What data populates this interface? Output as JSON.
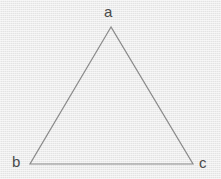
{
  "figure": {
    "type": "triangle-diagram",
    "canvas": {
      "width": 221,
      "height": 179
    },
    "colors": {
      "background": "#e9e9e9",
      "stroke": "#8a8a8a",
      "label_text": "#4a4a4a"
    },
    "stroke_width": 1.2,
    "vertices": [
      {
        "id": "a",
        "label": "a",
        "x": 111,
        "y": 27,
        "role": "apex"
      },
      {
        "id": "b",
        "label": "b",
        "x": 30,
        "y": 164,
        "role": "bottom-left"
      },
      {
        "id": "c",
        "label": "c",
        "x": 193,
        "y": 164,
        "role": "bottom-right"
      }
    ],
    "edges": [
      {
        "id": "ab",
        "from": "a",
        "to": "b"
      },
      {
        "id": "bc",
        "from": "b",
        "to": "c"
      },
      {
        "id": "ca",
        "from": "c",
        "to": "a"
      }
    ],
    "labels": {
      "a": "a",
      "b": "b",
      "c": "c"
    }
  }
}
